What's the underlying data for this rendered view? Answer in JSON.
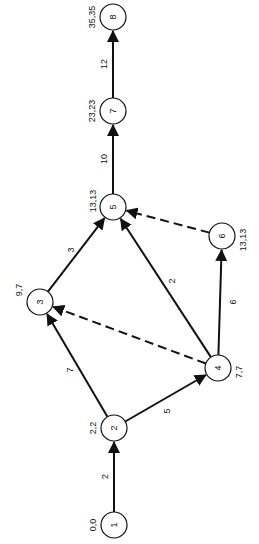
{
  "diagram": {
    "type": "activity-network",
    "orientation": "rotated-90-ccw",
    "nodes": [
      {
        "id": "1",
        "label": "1",
        "times": "0,0",
        "x": 114,
        "y": 525
      },
      {
        "id": "2",
        "label": "2",
        "times": "2,2",
        "x": 114,
        "y": 428
      },
      {
        "id": "3",
        "label": "3",
        "times": "9,7",
        "x": 40,
        "y": 302
      },
      {
        "id": "4",
        "label": "4",
        "times": "7,7",
        "x": 218,
        "y": 368
      },
      {
        "id": "5",
        "label": "5",
        "times": "13,13",
        "x": 113,
        "y": 207
      },
      {
        "id": "6",
        "label": "6",
        "times": "13,13",
        "x": 222,
        "y": 236
      },
      {
        "id": "7",
        "label": "7",
        "times": "23,23",
        "x": 113,
        "y": 111
      },
      {
        "id": "8",
        "label": "8",
        "times": "35,35",
        "x": 113,
        "y": 17
      }
    ],
    "edges": [
      {
        "from": "1",
        "to": "2",
        "weight": "2",
        "dashed": false
      },
      {
        "from": "2",
        "to": "3",
        "weight": "7",
        "dashed": false
      },
      {
        "from": "2",
        "to": "4",
        "weight": "5",
        "dashed": false
      },
      {
        "from": "3",
        "to": "5",
        "weight": "3",
        "dashed": false
      },
      {
        "from": "4",
        "to": "3",
        "weight": "",
        "dashed": true
      },
      {
        "from": "4",
        "to": "5",
        "weight": "2",
        "dashed": false
      },
      {
        "from": "4",
        "to": "6",
        "weight": "6",
        "dashed": false
      },
      {
        "from": "6",
        "to": "5",
        "weight": "",
        "dashed": true
      },
      {
        "from": "5",
        "to": "7",
        "weight": "10",
        "dashed": false
      },
      {
        "from": "7",
        "to": "8",
        "weight": "12",
        "dashed": false
      }
    ]
  }
}
